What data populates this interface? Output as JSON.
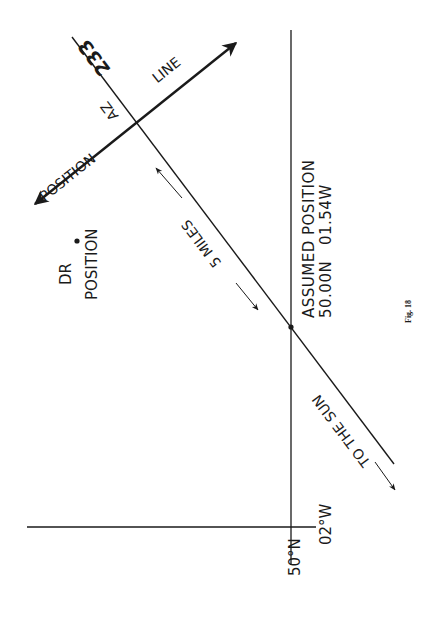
{
  "figure": {
    "caption": "Fig. 18",
    "background": "#ffffff",
    "ink": "#1a1a1a"
  },
  "grid": {
    "parallel_label": "50°N",
    "meridian_label": "02°W"
  },
  "labels": {
    "dr_position_line1": "DR",
    "dr_position_line2": "POSITION",
    "assumed_position_line1": "ASSUMED POSITION",
    "assumed_position_line2": "50.00N   01.54W",
    "azimuth_value": "233",
    "azimuth_prefix": "AZ",
    "position_line_word1": "POSITION",
    "position_line_word2": "LINE",
    "intercept": "5 MILES",
    "to_the_sun": "TO THE SUN"
  }
}
